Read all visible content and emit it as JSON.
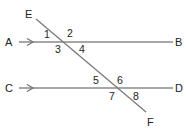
{
  "diagram": {
    "colors": {
      "line": "#8a8a8a",
      "arrow": "#6f6f6f",
      "text": "#222222",
      "background": "#ffffff"
    },
    "lines": [
      {
        "id": "AB",
        "from": "A",
        "to": "B",
        "parallel_arrow": true
      },
      {
        "id": "CD",
        "from": "C",
        "to": "D",
        "parallel_arrow": true
      },
      {
        "id": "EF",
        "from": "E",
        "to": "F",
        "role": "transversal"
      }
    ],
    "points": {
      "A": "A",
      "B": "B",
      "C": "C",
      "D": "D",
      "E": "E",
      "F": "F"
    },
    "angles": {
      "a1": "1",
      "a2": "2",
      "a3": "3",
      "a4": "4",
      "a5": "5",
      "a6": "6",
      "a7": "7",
      "a8": "8"
    }
  }
}
